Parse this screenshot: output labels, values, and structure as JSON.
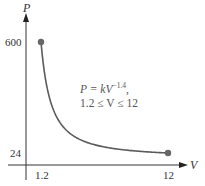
{
  "chart_data": {
    "type": "line",
    "title": "",
    "xlabel": "V",
    "ylabel": "P",
    "function": "P = kV^-1.4",
    "k": 772,
    "domain": [
      1.2,
      12
    ],
    "x": [
      1.2,
      1.5,
      2,
      2.5,
      3,
      4,
      5,
      6,
      7,
      8,
      9,
      10,
      11,
      12
    ],
    "series": [
      {
        "name": "P = kV^-1.4",
        "values": [
          600,
          438,
          292,
          213,
          166,
          110,
          81,
          63,
          51,
          42,
          36,
          31,
          27,
          24
        ]
      }
    ],
    "endpoints": [
      {
        "V": 1.2,
        "P": 600
      },
      {
        "V": 12,
        "P": 24
      }
    ],
    "x_ticks": [
      "1.2",
      "12"
    ],
    "y_ticks": [
      "24",
      "600"
    ],
    "annotation": {
      "line1_prefix": "P = kV",
      "line1_exponent": "−1.4",
      "line1_suffix": ",",
      "line2": "1.2 ≤ V ≤ 12"
    },
    "grid": false,
    "legend": "none",
    "colors": {
      "curve": "#5a5a5a",
      "axis": "#333333",
      "point": "#666666"
    }
  }
}
